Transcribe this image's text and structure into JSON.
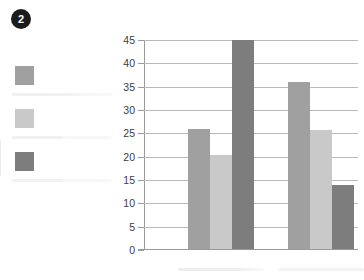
{
  "badge": {
    "number": "2",
    "icon": "numbered-badge-icon"
  },
  "legend": {
    "items": [
      {
        "swatch_color": "#a0a0a0",
        "label": "",
        "label_state": "blurred-placeholder"
      },
      {
        "swatch_color": "#c9c9c9",
        "label": "",
        "label_state": "blurred-placeholder"
      },
      {
        "swatch_color": "#7d7d7d",
        "label": "",
        "label_state": "blurred-placeholder"
      }
    ]
  },
  "colors": {
    "series_1": "#a0a0a0",
    "series_2": "#c9c9c9",
    "series_3": "#7d7d7d",
    "axis": "#9a9a9a",
    "gridline": "#b9b9b9",
    "badge_background": "#1b1b1b",
    "badge_text": "#ffffff",
    "tick_label": "#3d3d3d",
    "background": "#ffffff"
  },
  "chart_data": {
    "type": "bar",
    "title": "",
    "xlabel": "",
    "ylabel": "",
    "ylim": [
      0,
      45
    ],
    "yticks": [
      0,
      5,
      10,
      15,
      20,
      25,
      30,
      35,
      40,
      45
    ],
    "ytick_labels": [
      "0",
      "5",
      "10",
      "15",
      "20",
      "25",
      "30",
      "35",
      "40",
      "45"
    ],
    "grid": true,
    "legend_position": "left",
    "categories": [
      "",
      ""
    ],
    "category_labels_state": "blurred-placeholder",
    "series": [
      {
        "name": "",
        "color": "#a0a0a0",
        "values": [
          25.7,
          35.7
        ]
      },
      {
        "name": "",
        "color": "#c9c9c9",
        "values": [
          20.1,
          25.5
        ]
      },
      {
        "name": "",
        "color": "#7d7d7d",
        "values": [
          44.7,
          13.8
        ]
      }
    ]
  }
}
